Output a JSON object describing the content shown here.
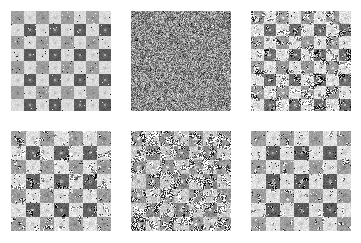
{
  "figure": {
    "title": "",
    "background_color": "#ffffff",
    "width": 361,
    "height": 243,
    "rows": 2,
    "columns": 3,
    "panel_count": 6
  },
  "palette": {
    "light_square": "#d9d9d9",
    "mid_square": "#9e9e9e",
    "dark_square": "#5a5a5a",
    "noise_background": "#8c8c8c",
    "speckle_dark": "#333333",
    "speckle_light": "#f0f0f0",
    "page_background": "#ffffff"
  },
  "chart_data": {
    "type": "heatmap",
    "title": "",
    "subtitle": "",
    "xlabel": "",
    "ylabel": "",
    "grid": false,
    "legend": "none",
    "layout": {
      "rows": 2,
      "cols": 3
    },
    "colormap": "gray",
    "value_range": [
      0,
      1
    ],
    "panels": [
      {
        "index": 1,
        "label": "",
        "position": {
          "row": 0,
          "col": 0,
          "x": 11,
          "y": 11,
          "width": 100,
          "height": 100
        },
        "pattern": "checkerboard",
        "board_size": 8,
        "cell_px": 12.5,
        "noise_level": 0.06,
        "noise_type": "light-speckle",
        "square_values": [
          [
            0.62,
            0.86,
            0.62,
            0.86,
            0.62,
            0.86,
            0.62,
            0.86
          ],
          [
            0.86,
            0.35,
            0.86,
            0.35,
            0.86,
            0.35,
            0.86,
            0.35
          ],
          [
            0.62,
            0.86,
            0.62,
            0.86,
            0.62,
            0.86,
            0.62,
            0.86
          ],
          [
            0.86,
            0.35,
            0.86,
            0.35,
            0.86,
            0.35,
            0.86,
            0.35
          ],
          [
            0.62,
            0.86,
            0.62,
            0.86,
            0.62,
            0.86,
            0.62,
            0.86
          ],
          [
            0.86,
            0.35,
            0.86,
            0.35,
            0.86,
            0.35,
            0.86,
            0.35
          ],
          [
            0.62,
            0.86,
            0.62,
            0.86,
            0.62,
            0.86,
            0.62,
            0.86
          ],
          [
            0.86,
            0.35,
            0.86,
            0.35,
            0.86,
            0.35,
            0.86,
            0.35
          ]
        ],
        "has_center_dots": true,
        "seed": 11
      },
      {
        "index": 2,
        "label": "",
        "position": {
          "row": 0,
          "col": 1,
          "x": 131,
          "y": 11,
          "width": 100,
          "height": 100
        },
        "pattern": "pure-noise",
        "board_size": 0,
        "cell_px": 0,
        "noise_level": 1.0,
        "noise_type": "dense-uniform",
        "mean_value": 0.55,
        "seed": 22
      },
      {
        "index": 3,
        "label": "",
        "position": {
          "row": 0,
          "col": 2,
          "x": 251,
          "y": 11,
          "width": 100,
          "height": 100
        },
        "pattern": "checkerboard-noisy",
        "board_size": 8,
        "cell_px": 12.5,
        "noise_level": 0.55,
        "noise_type": "clustered-blob",
        "square_values": [
          [
            0.6,
            0.88,
            0.6,
            0.88,
            0.6,
            0.88,
            0.6,
            0.88
          ],
          [
            0.88,
            0.42,
            0.88,
            0.42,
            0.88,
            0.42,
            0.88,
            0.42
          ],
          [
            0.6,
            0.88,
            0.6,
            0.88,
            0.6,
            0.88,
            0.6,
            0.88
          ],
          [
            0.88,
            0.42,
            0.88,
            0.42,
            0.88,
            0.42,
            0.88,
            0.42
          ],
          [
            0.6,
            0.88,
            0.6,
            0.88,
            0.6,
            0.88,
            0.6,
            0.88
          ],
          [
            0.88,
            0.42,
            0.88,
            0.42,
            0.88,
            0.42,
            0.88,
            0.42
          ],
          [
            0.6,
            0.88,
            0.6,
            0.88,
            0.6,
            0.88,
            0.6,
            0.88
          ],
          [
            0.88,
            0.42,
            0.88,
            0.42,
            0.88,
            0.42,
            0.88,
            0.42
          ]
        ],
        "has_center_dots": true,
        "seed": 33
      },
      {
        "index": 4,
        "label": "",
        "position": {
          "row": 1,
          "col": 0,
          "x": 11,
          "y": 131,
          "width": 100,
          "height": 100
        },
        "pattern": "checkerboard-noisy",
        "board_size": 7,
        "cell_px": 14.3,
        "noise_level": 0.38,
        "noise_type": "clustered-blob",
        "square_values": [
          [
            0.62,
            0.88,
            0.62,
            0.88,
            0.62,
            0.88,
            0.62
          ],
          [
            0.88,
            0.38,
            0.88,
            0.38,
            0.88,
            0.38,
            0.88
          ],
          [
            0.62,
            0.88,
            0.62,
            0.88,
            0.62,
            0.88,
            0.62
          ],
          [
            0.88,
            0.38,
            0.88,
            0.38,
            0.88,
            0.38,
            0.88
          ],
          [
            0.62,
            0.88,
            0.62,
            0.88,
            0.62,
            0.88,
            0.62
          ],
          [
            0.88,
            0.38,
            0.88,
            0.38,
            0.88,
            0.38,
            0.88
          ],
          [
            0.62,
            0.88,
            0.62,
            0.88,
            0.62,
            0.88,
            0.62
          ]
        ],
        "has_center_dots": true,
        "seed": 44
      },
      {
        "index": 5,
        "label": "",
        "position": {
          "row": 1,
          "col": 1,
          "x": 131,
          "y": 131,
          "width": 100,
          "height": 100
        },
        "pattern": "checkerboard-noisy",
        "board_size": 7,
        "cell_px": 14.3,
        "noise_level": 0.72,
        "noise_type": "clustered-blob",
        "square_values": [
          [
            0.58,
            0.8,
            0.58,
            0.8,
            0.58,
            0.8,
            0.58
          ],
          [
            0.8,
            0.52,
            0.8,
            0.52,
            0.8,
            0.52,
            0.8
          ],
          [
            0.58,
            0.8,
            0.58,
            0.8,
            0.58,
            0.8,
            0.58
          ],
          [
            0.8,
            0.52,
            0.8,
            0.52,
            0.8,
            0.52,
            0.8
          ],
          [
            0.58,
            0.8,
            0.58,
            0.8,
            0.58,
            0.8,
            0.58
          ],
          [
            0.8,
            0.52,
            0.8,
            0.52,
            0.8,
            0.52,
            0.8
          ],
          [
            0.58,
            0.8,
            0.58,
            0.8,
            0.58,
            0.8,
            0.58
          ]
        ],
        "has_center_dots": true,
        "seed": 55
      },
      {
        "index": 6,
        "label": "",
        "position": {
          "row": 1,
          "col": 2,
          "x": 251,
          "y": 131,
          "width": 100,
          "height": 100
        },
        "pattern": "checkerboard-noisy",
        "board_size": 7,
        "cell_px": 14.3,
        "noise_level": 0.28,
        "noise_type": "clustered-blob",
        "square_values": [
          [
            0.62,
            0.88,
            0.62,
            0.88,
            0.62,
            0.88,
            0.62
          ],
          [
            0.88,
            0.36,
            0.88,
            0.36,
            0.88,
            0.36,
            0.88
          ],
          [
            0.62,
            0.88,
            0.62,
            0.88,
            0.62,
            0.88,
            0.62
          ],
          [
            0.88,
            0.36,
            0.88,
            0.36,
            0.88,
            0.36,
            0.88
          ],
          [
            0.62,
            0.88,
            0.62,
            0.88,
            0.62,
            0.88,
            0.62
          ],
          [
            0.88,
            0.36,
            0.88,
            0.36,
            0.88,
            0.36,
            0.88
          ],
          [
            0.62,
            0.88,
            0.62,
            0.88,
            0.62,
            0.88,
            0.62
          ]
        ],
        "has_center_dots": true,
        "seed": 66
      }
    ]
  }
}
